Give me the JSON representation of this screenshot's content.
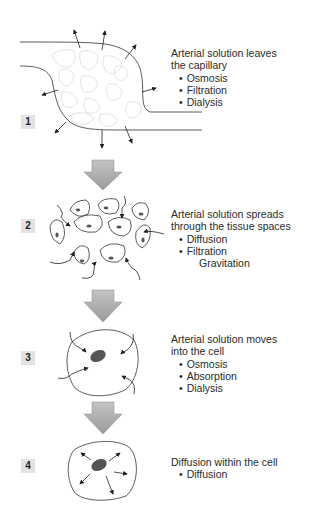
{
  "steps": [
    {
      "number": "1",
      "title_lines": [
        "Arterial solution leaves",
        "the capillary"
      ],
      "processes": [
        "Osmosis",
        "Filtration",
        "Dialysis"
      ]
    },
    {
      "number": "2",
      "title_lines": [
        "Arterial solution spreads",
        "through the tissue spaces"
      ],
      "processes": [
        "Diffusion",
        "Filtration"
      ],
      "extra": "Gravitation"
    },
    {
      "number": "3",
      "title_lines": [
        "Arterial solution moves",
        "into the cell"
      ],
      "processes": [
        "Osmosis",
        "Absorption",
        "Dialysis"
      ]
    },
    {
      "number": "4",
      "title_lines": [
        "Diffusion within the cell"
      ],
      "processes": [
        "Diffusion"
      ]
    }
  ],
  "colors": {
    "arrow_fill": "#a9a9a9",
    "badge_bg": "#e3e3e3",
    "nucleus": "#555555",
    "line": "#333333"
  }
}
